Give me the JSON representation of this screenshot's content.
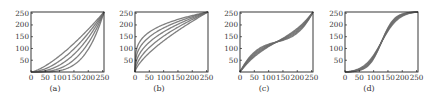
{
  "chart_data": [
    {
      "type": "line",
      "caption": "(a)",
      "title": "",
      "xlabel": "",
      "ylabel": "",
      "xlim": [
        0,
        255
      ],
      "ylim": [
        0,
        255
      ],
      "xticks": [
        0,
        50,
        100,
        150,
        200,
        250
      ],
      "yticks": [
        50,
        100,
        150,
        200,
        250
      ],
      "grid": false,
      "legend": null,
      "description": "Convex power-law tone curves y = 255*(x/255)^g",
      "series": [
        {
          "name": "g=1.4",
          "gamma": 1.4
        },
        {
          "name": "g=1.8",
          "gamma": 1.8
        },
        {
          "name": "g=2.3",
          "gamma": 2.3
        },
        {
          "name": "g=3.0",
          "gamma": 3.0
        },
        {
          "name": "g=4.0",
          "gamma": 4.0
        }
      ]
    },
    {
      "type": "line",
      "caption": "(b)",
      "title": "",
      "xlabel": "",
      "ylabel": "",
      "xlim": [
        0,
        255
      ],
      "ylim": [
        0,
        255
      ],
      "xticks": [
        0,
        50,
        100,
        150,
        200,
        250
      ],
      "yticks": [
        50,
        100,
        150,
        200,
        250
      ],
      "grid": false,
      "legend": null,
      "description": "Concave power-law tone curves y = 255*(x/255)^g",
      "series": [
        {
          "name": "g=0.25",
          "gamma": 0.25
        },
        {
          "name": "g=0.33",
          "gamma": 0.33
        },
        {
          "name": "g=0.43",
          "gamma": 0.43
        },
        {
          "name": "g=0.55",
          "gamma": 0.55
        },
        {
          "name": "g=0.7",
          "gamma": 0.7
        }
      ]
    },
    {
      "type": "line",
      "caption": "(c)",
      "title": "",
      "xlabel": "",
      "ylabel": "",
      "xlim": [
        0,
        255
      ],
      "ylim": [
        0,
        255
      ],
      "xticks": [
        0,
        50,
        100,
        150,
        200,
        250
      ],
      "yticks": [
        50,
        100,
        150,
        200,
        250
      ],
      "grid": false,
      "legend": null,
      "description": "Inverse-S tone curves crossing at (128,128)",
      "series": [
        {
          "name": "s=0.30",
          "strength": 0.3
        },
        {
          "name": "s=0.40",
          "strength": 0.4
        },
        {
          "name": "s=0.50",
          "strength": 0.5
        },
        {
          "name": "s=0.60",
          "strength": 0.6
        },
        {
          "name": "s=0.70",
          "strength": 0.7
        }
      ]
    },
    {
      "type": "line",
      "caption": "(d)",
      "title": "",
      "xlabel": "",
      "ylabel": "",
      "xlim": [
        0,
        255
      ],
      "ylim": [
        0,
        255
      ],
      "xticks": [
        0,
        50,
        100,
        150,
        200,
        250
      ],
      "yticks": [
        50,
        100,
        150,
        200,
        250
      ],
      "grid": false,
      "legend": null,
      "description": "S-shaped tone curves crossing at (128,128)",
      "series": [
        {
          "name": "s=0.55",
          "strength": 0.55
        },
        {
          "name": "s=0.65",
          "strength": 0.65
        },
        {
          "name": "s=0.75",
          "strength": 0.75
        },
        {
          "name": "s=0.85",
          "strength": 0.85
        },
        {
          "name": "s=0.95",
          "strength": 0.95
        }
      ]
    }
  ],
  "panels": [
    {
      "caption": "(a)"
    },
    {
      "caption": "(b)"
    },
    {
      "caption": "(c)"
    },
    {
      "caption": "(d)"
    }
  ],
  "style": {
    "line_color": "#6a6a6a",
    "axis_color": "#222222",
    "background": "#ffffff"
  }
}
